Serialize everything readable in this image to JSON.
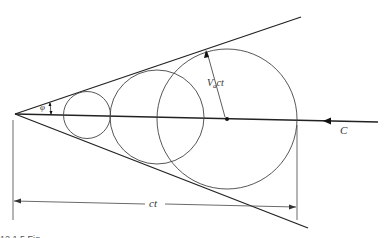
{
  "diagram": {
    "labels": {
      "angle": "φ",
      "radius": "V",
      "radius_sub": "a",
      "radius_rest": "ct",
      "source": "C",
      "distance": "ct"
    },
    "caption_fragment": "12.1.5  Fig..."
  }
}
